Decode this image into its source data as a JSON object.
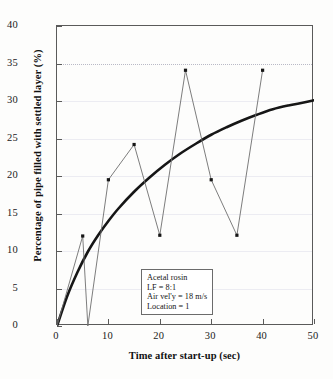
{
  "chart_data": {
    "type": "line",
    "title": "",
    "subtitle": "",
    "xlabel": "Time after start-up (sec)",
    "ylabel": "Percentage of pipe filled with settled layer (%)",
    "xlim": [
      0,
      50
    ],
    "ylim": [
      0,
      40
    ],
    "xticks": [
      0,
      10,
      20,
      30,
      40,
      50
    ],
    "yticks": [
      0,
      5,
      10,
      15,
      20,
      25,
      30,
      35,
      40
    ],
    "xtick_labels": [
      "0",
      "10",
      "20",
      "30",
      "40",
      "50"
    ],
    "ytick_labels": [
      "0",
      "5",
      "10",
      "15",
      "20",
      "25",
      "30",
      "35",
      "40"
    ],
    "grid": true,
    "legend": "none",
    "series": [
      {
        "name": "measured-data",
        "style": "thin-line-with-square-markers",
        "markers": true,
        "points": [
          {
            "x": 0,
            "y": 0
          },
          {
            "x": 5,
            "y": 12.0
          },
          {
            "x": 6,
            "y": 0
          },
          {
            "x": 10,
            "y": 19.5
          },
          {
            "x": 15,
            "y": 24.2
          },
          {
            "x": 20,
            "y": 12.1
          },
          {
            "x": 25,
            "y": 34.1
          },
          {
            "x": 30,
            "y": 19.5
          },
          {
            "x": 35,
            "y": 12.1
          },
          {
            "x": 40,
            "y": 34.1
          }
        ]
      },
      {
        "name": "model-curve",
        "style": "thick-smooth-curve",
        "markers": false,
        "points": [
          {
            "x": 0,
            "y": 0
          },
          {
            "x": 2,
            "y": 4.0
          },
          {
            "x": 4,
            "y": 7.2
          },
          {
            "x": 6,
            "y": 9.9
          },
          {
            "x": 8,
            "y": 12.1
          },
          {
            "x": 10,
            "y": 14.0
          },
          {
            "x": 12,
            "y": 15.7
          },
          {
            "x": 15,
            "y": 17.9
          },
          {
            "x": 18,
            "y": 19.8
          },
          {
            "x": 21,
            "y": 21.5
          },
          {
            "x": 24,
            "y": 23.0
          },
          {
            "x": 27,
            "y": 24.3
          },
          {
            "x": 30,
            "y": 25.5
          },
          {
            "x": 33,
            "y": 26.5
          },
          {
            "x": 36,
            "y": 27.4
          },
          {
            "x": 39,
            "y": 28.2
          },
          {
            "x": 42,
            "y": 28.9
          },
          {
            "x": 45,
            "y": 29.4
          },
          {
            "x": 48,
            "y": 29.8
          },
          {
            "x": 50,
            "y": 30.1
          }
        ]
      }
    ],
    "annotations": [
      {
        "name": "conditions-box",
        "x": 17,
        "y": 7.5,
        "lines": [
          "Acetal rosin",
          "LF = 8:1",
          "Air vel'y = 18 m/s",
          "Location = 1"
        ]
      }
    ]
  },
  "colors": {
    "axis": "#5a5a5a",
    "grid": "#ececf2",
    "grid_dotted": "#b9b9c6",
    "data_line": "#6e6e6e",
    "model_line": "#161616",
    "marker": "#161616",
    "text": "#111111",
    "background": "#fdfdfc"
  }
}
